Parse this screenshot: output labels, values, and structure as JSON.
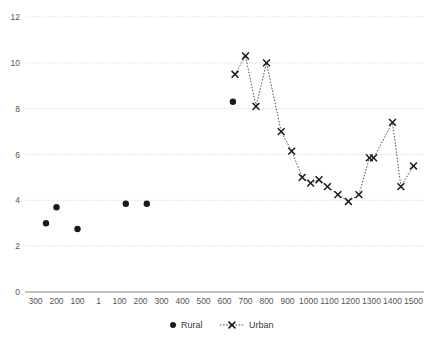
{
  "chart_data": {
    "type": "scatter",
    "title": "",
    "subtitle": "",
    "xlabel": "",
    "ylabel": "",
    "xlim": [
      -350,
      1550
    ],
    "ylim": [
      0,
      12
    ],
    "grid": true,
    "legend_position": "bottom",
    "y_ticks": [
      0,
      2,
      4,
      6,
      8,
      10,
      12
    ],
    "y_tick_labels": [
      "0",
      "2",
      "4",
      "6",
      "8",
      "10",
      "12"
    ],
    "x_ticks": [
      -300,
      -200,
      -100,
      1,
      100,
      200,
      300,
      400,
      500,
      600,
      700,
      800,
      900,
      1000,
      1100,
      1200,
      1300,
      1400,
      1500
    ],
    "x_tick_labels": [
      "300",
      "200",
      "100",
      "1",
      "100",
      "200",
      "300",
      "400",
      "500",
      "600",
      "700",
      "800",
      "900",
      "1000",
      "1100",
      "1200",
      "1300",
      "1400",
      "1500"
    ],
    "series": [
      {
        "name": "Rural",
        "marker": "circle",
        "connected": false,
        "color": "#1a1a1a",
        "points": [
          {
            "x": -250,
            "y": 3.0
          },
          {
            "x": -200,
            "y": 3.7
          },
          {
            "x": -100,
            "y": 2.75
          },
          {
            "x": 130,
            "y": 3.85
          },
          {
            "x": 230,
            "y": 3.85
          },
          {
            "x": 640,
            "y": 8.3
          }
        ]
      },
      {
        "name": "Urban",
        "marker": "x",
        "connected": true,
        "line_style": "dotted",
        "color": "#1a1a1a",
        "points": [
          {
            "x": 650,
            "y": 9.5
          },
          {
            "x": 700,
            "y": 10.3
          },
          {
            "x": 750,
            "y": 8.1
          },
          {
            "x": 800,
            "y": 10.0
          },
          {
            "x": 870,
            "y": 7.0
          },
          {
            "x": 920,
            "y": 6.15
          },
          {
            "x": 970,
            "y": 5.0
          },
          {
            "x": 1010,
            "y": 4.75
          },
          {
            "x": 1050,
            "y": 4.9
          },
          {
            "x": 1090,
            "y": 4.6
          },
          {
            "x": 1140,
            "y": 4.25
          },
          {
            "x": 1190,
            "y": 3.95
          },
          {
            "x": 1240,
            "y": 4.25
          },
          {
            "x": 1290,
            "y": 5.85
          },
          {
            "x": 1310,
            "y": 5.85
          },
          {
            "x": 1400,
            "y": 7.4
          },
          {
            "x": 1440,
            "y": 4.6
          },
          {
            "x": 1500,
            "y": 5.5
          }
        ]
      }
    ],
    "legend": [
      {
        "label": "Rural",
        "marker": "circle"
      },
      {
        "label": "Urban",
        "marker": "x-dotted"
      }
    ]
  }
}
